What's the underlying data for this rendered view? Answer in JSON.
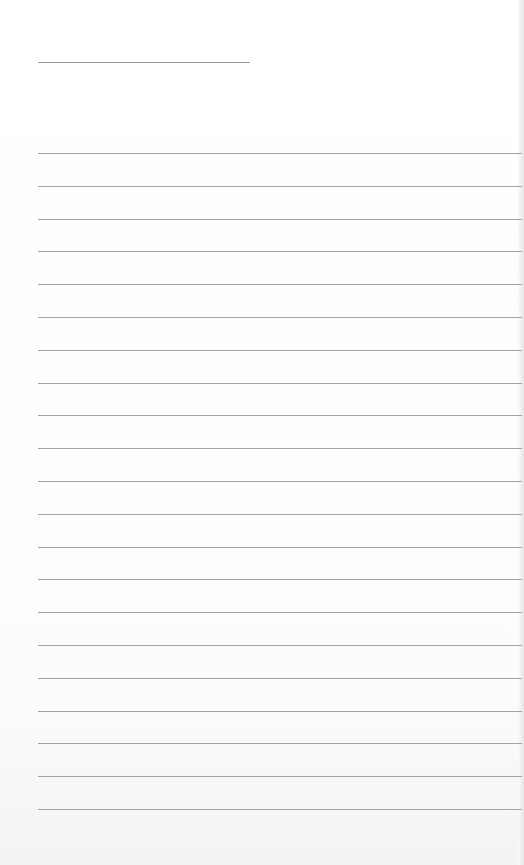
{
  "page": {
    "type": "lined-paper",
    "background": "#fdfdfd",
    "line_color": "#a4a4a4",
    "title_line": {
      "x": 38,
      "y": 62,
      "width": 212
    },
    "rules": {
      "count": 21,
      "first_y": 153,
      "spacing": 32.8,
      "left": 38
    }
  }
}
